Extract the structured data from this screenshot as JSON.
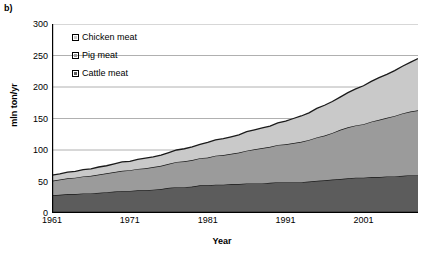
{
  "panel": {
    "label": "b)"
  },
  "chart_data": {
    "type": "area",
    "stacked": true,
    "title": "",
    "xlabel": "Year",
    "ylabel": "mln ton/yr",
    "xlim": [
      1961,
      2008
    ],
    "ylim": [
      0,
      300
    ],
    "yticks": [
      0,
      50,
      100,
      150,
      200,
      250,
      300
    ],
    "xticks": [
      1961,
      1971,
      1981,
      1991,
      2001
    ],
    "grid": "horizontal",
    "legend_position": "top-left",
    "colors": {
      "cattle": "#5c5c5c",
      "pig": "#9b9b9b",
      "chicken": "#c9c9c9",
      "outline": "#1a1a1a",
      "gridline": "#b0b0b0",
      "axis": "#000000"
    },
    "x": [
      1961,
      1962,
      1963,
      1964,
      1965,
      1966,
      1967,
      1968,
      1969,
      1970,
      1971,
      1972,
      1973,
      1974,
      1975,
      1976,
      1977,
      1978,
      1979,
      1980,
      1981,
      1982,
      1983,
      1984,
      1985,
      1986,
      1987,
      1988,
      1989,
      1990,
      1991,
      1992,
      1993,
      1994,
      1995,
      1996,
      1997,
      1998,
      1999,
      2000,
      2001,
      2002,
      2003,
      2004,
      2005,
      2006,
      2007,
      2008
    ],
    "series": [
      {
        "name": "Cattle meat",
        "key": "cattle",
        "color": "#5c5c5c",
        "values": [
          28,
          29,
          30,
          30,
          31,
          31,
          32,
          33,
          34,
          35,
          35,
          36,
          36,
          37,
          38,
          40,
          41,
          41,
          42,
          44,
          44,
          45,
          45,
          46,
          46,
          47,
          47,
          47,
          48,
          49,
          49,
          49,
          49,
          50,
          51,
          52,
          53,
          54,
          55,
          56,
          56,
          57,
          57,
          58,
          58,
          59,
          60,
          60
        ]
      },
      {
        "name": "Pig meat",
        "key": "pig",
        "color": "#9b9b9b",
        "values": [
          23,
          24,
          25,
          26,
          27,
          28,
          29,
          30,
          31,
          32,
          33,
          34,
          35,
          36,
          37,
          38,
          40,
          41,
          42,
          43,
          44,
          46,
          47,
          48,
          50,
          52,
          54,
          56,
          57,
          59,
          60,
          62,
          64,
          66,
          69,
          71,
          74,
          78,
          81,
          83,
          85,
          88,
          91,
          93,
          96,
          99,
          101,
          103
        ]
      },
      {
        "name": "Chicken meat",
        "key": "chicken",
        "color": "#c9c9c9",
        "values": [
          9,
          9,
          10,
          10,
          11,
          11,
          12,
          12,
          13,
          14,
          14,
          15,
          16,
          16,
          17,
          18,
          19,
          20,
          21,
          22,
          24,
          25,
          26,
          27,
          28,
          30,
          31,
          32,
          33,
          35,
          37,
          39,
          41,
          43,
          46,
          48,
          50,
          52,
          55,
          58,
          61,
          64,
          67,
          69,
          72,
          75,
          78,
          82
        ]
      }
    ]
  },
  "axis_labels": {
    "y": "mln ton/yr",
    "x": "Year"
  },
  "legend": {
    "items": [
      {
        "label": "Chicken meat",
        "key": "chicken"
      },
      {
        "label": "Pig meat",
        "key": "pig"
      },
      {
        "label": "Cattle meat",
        "key": "cattle"
      }
    ]
  }
}
